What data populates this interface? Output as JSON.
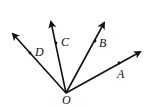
{
  "diagram": {
    "type": "rays-from-point",
    "vertex": {
      "label": "O",
      "x": 66,
      "y": 93
    },
    "rays": [
      {
        "label": "A",
        "tip": [
          141,
          51
        ],
        "dot": [
          119,
          63
        ]
      },
      {
        "label": "B",
        "tip": [
          105,
          22
        ],
        "dot": [
          95,
          41
        ]
      },
      {
        "label": "C",
        "tip": [
          51,
          21
        ],
        "dot": [
          56,
          43
        ]
      },
      {
        "label": "D",
        "tip": [
          12,
          33
        ],
        "dot": [
          30,
          53
        ]
      }
    ],
    "colors": {
      "stroke": "#111111",
      "background": "#ffffff"
    }
  },
  "labels": {
    "O": "O",
    "A": "A",
    "B": "B",
    "C": "C",
    "D": "D"
  }
}
